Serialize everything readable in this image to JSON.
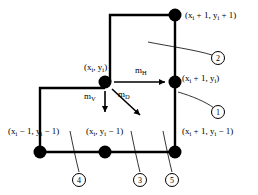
{
  "figure": {
    "type": "grid-neighborhood-diagram",
    "background": "#ffffff",
    "stroke": "#000000",
    "node_fill": "#000000",
    "width": 258,
    "height": 195
  },
  "nodes": [
    {
      "id": "n-top-right",
      "label": "(xᵢ + 1, yᵢ + 1)",
      "x": 175,
      "y": 15,
      "r": 6.5
    },
    {
      "id": "n-center",
      "label": "(xᵢ, yᵢ)",
      "x": 105,
      "y": 82,
      "r": 6.5
    },
    {
      "id": "n-right",
      "label": "(xᵢ + 1, yᵢ)",
      "x": 175,
      "y": 82,
      "r": 6.5
    },
    {
      "id": "n-bottom-left",
      "label": "(xᵢ − 1, yᵢ − 1)",
      "x": 40,
      "y": 152,
      "r": 6.5
    },
    {
      "id": "n-bottom-mid",
      "label": "(xᵢ, yᵢ − 1)",
      "x": 105,
      "y": 152,
      "r": 6.5
    },
    {
      "id": "n-bottom-right",
      "label": "(xᵢ + 1, yᵢ − 1)",
      "x": 175,
      "y": 152,
      "r": 6.5
    }
  ],
  "labels": {
    "top_right": {
      "text_html": "(x<sub>i</sub> + 1, y<sub>i</sub> + 1)",
      "x": 185,
      "y": 11
    },
    "center": {
      "text_html": "(x<sub>i</sub>, y<sub>i</sub>)",
      "x": 84,
      "y": 63
    },
    "right": {
      "text_html": "(x<sub>i</sub> + 1, y<sub>i</sub>)",
      "x": 182,
      "y": 74
    },
    "bottom_left": {
      "text_html": "(x<sub>i</sub> − 1, y<sub>i</sub> − 1)",
      "x": 8,
      "y": 127
    },
    "bottom_mid": {
      "text_html": "(x<sub>i</sub>, y<sub>i</sub> − 1)",
      "x": 86,
      "y": 127
    },
    "bottom_right": {
      "text_html": "(x<sub>i</sub> + 1, y<sub>i</sub> − 1)",
      "x": 182,
      "y": 127
    }
  },
  "vectors": [
    {
      "id": "m-horizontal",
      "text_html": "m<sub>H</sub>",
      "label_x": 135,
      "label_y": 66,
      "from": [
        114,
        82
      ],
      "to": [
        165,
        82
      ],
      "direction": "right"
    },
    {
      "id": "m-vertical",
      "text_html": "m<sub>V</sub>",
      "label_x": 84,
      "label_y": 92,
      "from": [
        105,
        91
      ],
      "to": [
        105,
        112
      ],
      "direction": "down"
    },
    {
      "id": "m-diagonal",
      "text_html": "m<sub>D</sub>",
      "label_x": 118,
      "label_y": 90,
      "from": [
        112,
        89
      ],
      "to": [
        140,
        115
      ],
      "direction": "down-right"
    }
  ],
  "callouts": [
    {
      "id": "callout-1",
      "number": "1",
      "cx": 218,
      "cy": 112,
      "leader": "M 178,92 C 192,96 206,102 214,108"
    },
    {
      "id": "callout-2",
      "number": "2",
      "cx": 218,
      "cy": 58,
      "leader": "M 148,42 C 168,46 196,50 212,55"
    },
    {
      "id": "callout-3",
      "number": "3",
      "cx": 140,
      "cy": 180,
      "leader": "M 131,131 C 134,146 137,160 140,172"
    },
    {
      "id": "callout-4",
      "number": "4",
      "cx": 79,
      "cy": 180,
      "leader": "M 70,131 C 73,146 76,160 79,172"
    },
    {
      "id": "callout-5",
      "number": "5",
      "cx": 172,
      "cy": 180,
      "leader": "M 163,131 C 166,146 169,160 172,172"
    }
  ],
  "grid_paths": {
    "upper_rect": "M 110,82 L 110,15 L 175,15 L 175,82",
    "left_branch": "M 40,152 L 40,88 L 105,88",
    "bottom_rail": "M 40,152 L 175,152",
    "right_rail": "M 175,82 L 175,152",
    "center_stub": "M 105,82 L 105,88"
  }
}
